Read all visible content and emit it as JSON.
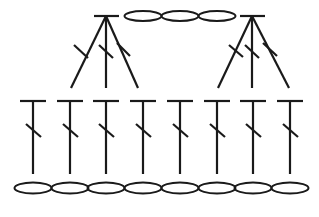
{
  "diagram": {
    "type": "crochet-stitch-chart",
    "stroke_color": "#1a1a1a",
    "background": "#ffffff",
    "top_chain": {
      "symbol": "chain-stitch",
      "count": 3,
      "ovals": [
        {
          "cx": 143,
          "cy": 16,
          "rx": 18.5,
          "ry": 5
        },
        {
          "cx": 180,
          "cy": 16,
          "rx": 18.5,
          "ry": 5
        },
        {
          "cx": 217,
          "cy": 16,
          "rx": 18.5,
          "ry": 5
        }
      ]
    },
    "clusters": [
      {
        "name": "left-3dc-cluster",
        "symbol": "double-crochet-3-together",
        "apex": {
          "x": 106,
          "y": 16
        },
        "bar": {
          "x1": 94,
          "x2": 119,
          "y": 16
        },
        "legs": [
          {
            "x": 71,
            "y": 88,
            "slash": {
              "x1": 74,
              "y1": 45,
              "x2": 88,
              "y2": 58
            }
          },
          {
            "x": 106,
            "y": 88,
            "slash": {
              "x1": 99,
              "y1": 45,
              "x2": 113,
              "y2": 58
            }
          },
          {
            "x": 138,
            "y": 88,
            "slash": {
              "x1": 117,
              "y1": 43,
              "x2": 130,
              "y2": 56
            }
          }
        ]
      },
      {
        "name": "right-3dc-cluster",
        "symbol": "double-crochet-3-together",
        "apex": {
          "x": 252,
          "y": 16
        },
        "bar": {
          "x1": 240,
          "x2": 265,
          "y": 16
        },
        "legs": [
          {
            "x": 218,
            "y": 88,
            "slash": {
              "x1": 229,
              "y1": 45,
              "x2": 243,
              "y2": 57
            }
          },
          {
            "x": 252,
            "y": 88,
            "slash": {
              "x1": 245,
              "y1": 45,
              "x2": 259,
              "y2": 58
            }
          },
          {
            "x": 289,
            "y": 88,
            "slash": {
              "x1": 263,
              "y1": 43,
              "x2": 277,
              "y2": 56
            }
          }
        ]
      }
    ],
    "dc_row": {
      "symbol": "double-crochet",
      "count": 8,
      "bar_y": 101,
      "bar_half_width": 13,
      "stem_bottom_y": 174,
      "stitches_x": [
        33,
        70,
        106,
        143,
        180,
        217,
        253,
        290
      ]
    },
    "bottom_chain": {
      "symbol": "chain-stitch",
      "count": 8,
      "cy": 188,
      "rx": 18.5,
      "ry": 5.5,
      "centers_x": [
        33,
        70,
        106,
        143,
        180,
        217,
        253,
        290
      ]
    }
  }
}
